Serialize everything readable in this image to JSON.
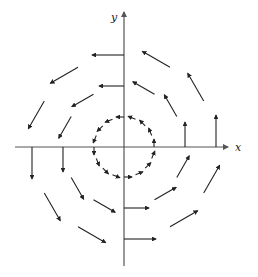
{
  "figure": {
    "axes": {
      "x_label": "x",
      "y_label": "y",
      "origin_px": [
        124,
        147
      ],
      "x_range_px": [
        15,
        228
      ],
      "y_range_px": [
        12,
        266
      ]
    },
    "colors": {
      "axis": "#555555",
      "arrow": "#222222",
      "background": "#ffffff"
    },
    "field": {
      "formula": "F(x, y) = -y i + x j",
      "rotation": "counterclockwise"
    },
    "rings": [
      {
        "name": "inner",
        "radius_px": 30,
        "arrow_count": 16,
        "arrow_length_px": 8
      },
      {
        "name": "middle",
        "radius_px": 61,
        "arrow_count": 12,
        "arrow_length_px": 25
      },
      {
        "name": "outer",
        "radius_px": 92,
        "arrow_count": 12,
        "arrow_length_px": 32
      }
    ]
  }
}
